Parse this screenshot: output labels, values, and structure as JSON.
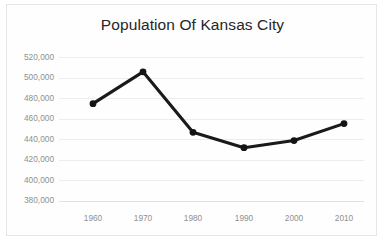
{
  "chart_data": {
    "type": "line",
    "title": "Population Of Kansas City",
    "xlabel": "",
    "ylabel": "",
    "categories": [
      "1960",
      "1970",
      "1980",
      "1990",
      "2000",
      "2010"
    ],
    "x": [
      1960,
      1970,
      1980,
      1990,
      2000,
      2010
    ],
    "values": [
      475000,
      506000,
      447000,
      432000,
      439000,
      455500
    ],
    "series": [
      {
        "name": "Population",
        "values": [
          475000,
          506000,
          447000,
          432000,
          439000,
          455500
        ]
      }
    ],
    "ylim": [
      380000,
      520000
    ],
    "yticks": [
      380000,
      400000,
      420000,
      440000,
      460000,
      480000,
      500000,
      520000
    ],
    "ytick_labels": [
      "380,000",
      "400,000",
      "420,000",
      "440,000",
      "460,000",
      "480,000",
      "500,000",
      "520,000"
    ],
    "xtick_labels": [
      "1960",
      "1970",
      "1980",
      "1990",
      "2000",
      "2010"
    ],
    "grid": true,
    "legend": false,
    "legend_position": "none",
    "line_color": "#1a1a1a",
    "marker_color": "#141414",
    "gridline_color": "#ededed",
    "label_color": "#909090",
    "title_color": "#262626",
    "background_color": "#fefefe"
  }
}
